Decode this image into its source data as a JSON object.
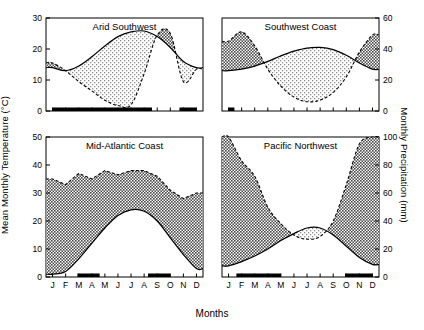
{
  "figure": {
    "axis_labels": {
      "left": "Mean Monthly Temperature (°C)",
      "right": "Monthly Precipitation (mm)",
      "bottom": "Months"
    },
    "month_ticks": [
      "J",
      "F",
      "M",
      "A",
      "M",
      "J",
      "J",
      "A",
      "S",
      "O",
      "N",
      "D"
    ]
  },
  "chart_data": {
    "type": "area",
    "title": "",
    "xlabel": "Months",
    "ylabel": "Mean Monthly Temperature (°C)",
    "y2label": "Monthly Precipitation (mm)",
    "grid": false,
    "legend": false,
    "x": [
      "J",
      "F",
      "M",
      "A",
      "M",
      "J",
      "J",
      "A",
      "S",
      "O",
      "N",
      "D"
    ],
    "note": "Walter-Lieth style climate diagrams. Precipitation axis is 2x the temperature axis in every panel. Shaded fill between the two curves; dark/dense hatch = precipitation above temperature (moist), light hatch = temperature above precipitation (dry). Black bars on the x-axis mark arid months.",
    "panels": [
      {
        "title": "Arid Southwest",
        "position": "top-left",
        "temp_axis": {
          "ticks": [
            0,
            10,
            20,
            30
          ],
          "min": 0,
          "max": 30
        },
        "precip_axis": {
          "ticks": [
            0,
            20,
            40,
            60
          ],
          "min": 0,
          "max": 60
        },
        "series": [
          {
            "name": "Mean Monthly Temperature (°C)",
            "units": "°C",
            "values": [
              14.0,
              13.0,
              14.5,
              17.5,
              21.0,
              24.0,
              25.5,
              25.8,
              24.0,
              20.5,
              16.0,
              14.0
            ]
          },
          {
            "name": "Monthly Precipitation (mm)",
            "units": "mm",
            "values": [
              31.0,
              26.0,
              19.0,
              13.0,
              7.0,
              3.5,
              4.0,
              24.0,
              49.0,
              50.0,
              19.0,
              27.0
            ]
          }
        ],
        "dry_bars": [
          {
            "from": 0.0,
            "to": 7.6
          },
          {
            "from": 9.7,
            "to": 11.0
          }
        ]
      },
      {
        "title": "Southwest Coast",
        "position": "top-right",
        "temp_axis": {
          "ticks": [
            0,
            10,
            20,
            30
          ],
          "min": 0,
          "max": 30
        },
        "precip_axis": {
          "ticks": [
            0,
            20,
            40,
            60
          ],
          "min": 0,
          "max": 60
        },
        "series": [
          {
            "name": "Mean Monthly Temperature (°C)",
            "units": "°C",
            "values": [
              13.0,
              13.5,
              14.5,
              16.0,
              17.8,
              19.3,
              20.3,
              20.5,
              19.8,
              18.0,
              15.5,
              13.5
            ]
          },
          {
            "name": "Monthly Precipitation (mm)",
            "units": "mm",
            "values": [
              45.0,
              51.0,
              42.0,
              27.0,
              16.0,
              9.0,
              6.0,
              7.0,
              12.0,
              22.0,
              38.0,
              49.0
            ]
          }
        ],
        "dry_bars": [
          {
            "from": 0.0,
            "to": 0.45
          }
        ]
      },
      {
        "title": "Mid-Atlantic Coast",
        "position": "bottom-left",
        "temp_axis": {
          "ticks": [
            0,
            10,
            20,
            30,
            40,
            50
          ],
          "min": 0,
          "max": 50
        },
        "precip_axis": {
          "ticks": [
            0,
            20,
            40,
            60,
            80,
            100
          ],
          "min": 0,
          "max": 100
        },
        "series": [
          {
            "name": "Mean Monthly Temperature (°C)",
            "units": "°C",
            "values": [
              1.0,
              2.0,
              6.5,
              12.0,
              17.5,
              22.0,
              24.0,
              23.5,
              20.0,
              14.0,
              8.0,
              3.0
            ]
          },
          {
            "name": "Monthly Precipitation (mm)",
            "units": "mm",
            "values": [
              70.0,
              66.0,
              74.0,
              70.0,
              76.0,
              73.0,
              76.0,
              76.0,
              72.0,
              62.0,
              56.0,
              60.0
            ]
          }
        ],
        "dry_bars": [
          {
            "from": 1.9,
            "to": 3.6
          },
          {
            "from": 7.3,
            "to": 9.0
          }
        ]
      },
      {
        "title": "Pacific Northwest",
        "position": "bottom-right",
        "temp_axis": {
          "ticks": [
            0,
            10,
            20,
            30,
            40,
            50
          ],
          "min": 0,
          "max": 50
        },
        "precip_axis": {
          "ticks": [
            0,
            20,
            40,
            60,
            80,
            100
          ],
          "min": 0,
          "max": 100
        },
        "series": [
          {
            "name": "Mean Monthly Temperature (°C)",
            "units": "°C",
            "values": [
              4.0,
              5.5,
              7.5,
              10.0,
              13.0,
              15.5,
              17.5,
              17.5,
              15.0,
              11.0,
              7.0,
              4.5
            ]
          },
          {
            "name": "Monthly Precipitation (mm)",
            "units": "mm",
            "values": [
              100.0,
              83.0,
              72.0,
              50.0,
              38.0,
              30.0,
              27.0,
              29.0,
              40.0,
              66.0,
              95.0,
              100.0
            ]
          }
        ],
        "dry_bars": [
          {
            "from": 0.6,
            "to": 4.0
          },
          {
            "from": 8.9,
            "to": 11.0
          }
        ]
      }
    ]
  }
}
